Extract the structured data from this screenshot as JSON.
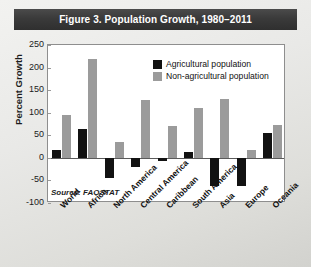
{
  "title": "Figure 3. Population Growth, 1980–2011",
  "source_note": "Source: FAOSTAT",
  "legend": {
    "entries": [
      {
        "label": "Agricultural population",
        "color": "#121212",
        "key": "agricultural"
      },
      {
        "label": "Non-agricultural population",
        "color": "#9b9b9b",
        "key": "nonagricultural"
      }
    ]
  },
  "colors": {
    "agricultural": "#121212",
    "nonagricultural": "#9b9b9b",
    "title_bar": "#3a3a3a",
    "title_text": "#ffffff",
    "plot_background": "#ffffff",
    "frame": "#8e8e8e",
    "page_background": "#e6e6e3"
  },
  "chart_data": {
    "type": "bar",
    "title": "Figure 3. Population Growth, 1980–2011",
    "subtitle": "",
    "xlabel": "",
    "ylabel": "Percent Growth",
    "ylim": [
      -100,
      250
    ],
    "ytick_step": 50,
    "yticks": [
      250,
      200,
      150,
      100,
      50,
      0,
      -50,
      -100
    ],
    "ytick_labels": [
      "250",
      "200",
      "150",
      "100",
      "50",
      "0",
      "-50",
      "-100"
    ],
    "grid": false,
    "legend_position": "top-right inside",
    "annotations": [
      "Source: FAOSTAT"
    ],
    "categories": [
      "World",
      "Africa",
      "North America",
      "Central America",
      "Caribbean",
      "South America",
      "Asia",
      "Europe",
      "Oceania"
    ],
    "series": [
      {
        "name": "Agricultural population",
        "color": "#121212",
        "values": [
          18,
          65,
          -45,
          -20,
          -8,
          12,
          -62,
          -62,
          55
        ]
      },
      {
        "name": "Non-agricultural population",
        "color": "#9b9b9b",
        "values": [
          95,
          220,
          35,
          128,
          70,
          110,
          130,
          18,
          72
        ]
      }
    ]
  }
}
